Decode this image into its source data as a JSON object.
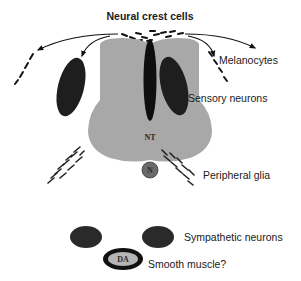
{
  "diagram": {
    "title": "Neural crest cells",
    "labels": {
      "melanocytes": "Melanocytes",
      "sensory_neurons": "Sensory neurons",
      "peripheral_glia": "Peripheral glia",
      "sympathetic_neurons": "Sympathetic neurons",
      "smooth_muscle": "Smooth muscle?"
    },
    "structures": {
      "neural_tube": "NT",
      "notochord": "N",
      "dorsal_aorta": "DA"
    },
    "colors": {
      "neural_tube_fill": "#a8a8a8",
      "ganglion_fill": "#1e1e1e",
      "notochord_fill": "#6a6a6a",
      "dorsal_aorta_fill": "#b5b5b5",
      "text": "#1a1a1a"
    }
  }
}
